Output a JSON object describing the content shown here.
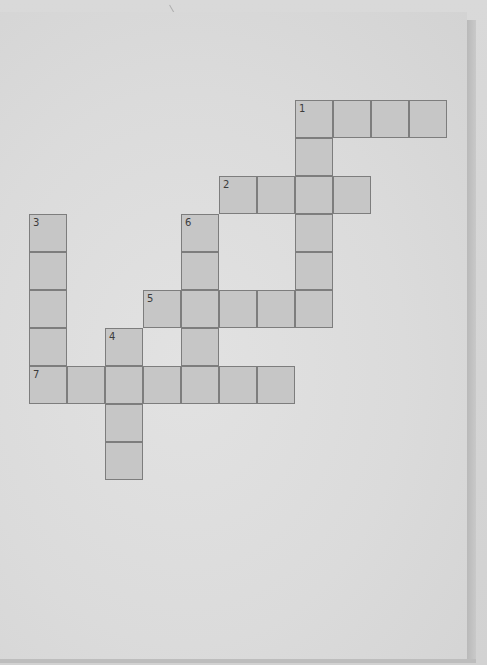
{
  "puzzle": {
    "type": "crossword",
    "cell_size_px": 38,
    "origin_px": {
      "x": 29,
      "y": 100
    },
    "colors": {
      "cell_fill": "#c6c6c6",
      "cell_border": "#7d7d7d",
      "paper": "#dedede",
      "number_text": "#3c3c3c"
    },
    "entries": [
      {
        "number": "1",
        "direction": "across",
        "row": 0,
        "col": 7,
        "length": 4
      },
      {
        "number": "1",
        "direction": "down",
        "row": 0,
        "col": 7,
        "length": 6
      },
      {
        "number": "2",
        "direction": "across",
        "row": 2,
        "col": 5,
        "length": 4
      },
      {
        "number": "3",
        "direction": "down",
        "row": 3,
        "col": 0,
        "length": 5
      },
      {
        "number": "4",
        "direction": "down",
        "row": 6,
        "col": 2,
        "length": 4
      },
      {
        "number": "5",
        "direction": "across",
        "row": 5,
        "col": 3,
        "length": 5
      },
      {
        "number": "6",
        "direction": "down",
        "row": 3,
        "col": 4,
        "length": 4
      },
      {
        "number": "7",
        "direction": "across",
        "row": 7,
        "col": 0,
        "length": 7
      }
    ],
    "numbered_cells": [
      {
        "label": "1",
        "row": 0,
        "col": 7
      },
      {
        "label": "2",
        "row": 2,
        "col": 5
      },
      {
        "label": "3",
        "row": 3,
        "col": 0
      },
      {
        "label": "4",
        "row": 6,
        "col": 2
      },
      {
        "label": "5",
        "row": 5,
        "col": 3
      },
      {
        "label": "6",
        "row": 3,
        "col": 4
      },
      {
        "label": "7",
        "row": 7,
        "col": 0
      }
    ]
  }
}
